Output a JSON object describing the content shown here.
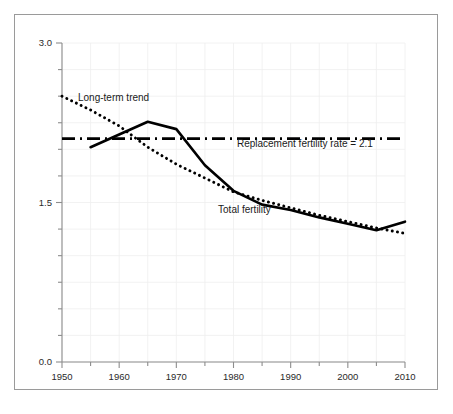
{
  "chart_data": {
    "type": "line",
    "title": "",
    "subtitle": "",
    "xlabel": "",
    "ylabel": "",
    "xlim": [
      1950,
      2010
    ],
    "ylim": [
      0.0,
      3.0
    ],
    "grid": true,
    "legend_position": "inline-annotations",
    "y_ticks": [
      0.0,
      1.5,
      3.0
    ],
    "y_tick_labels": [
      "0.0",
      "1.5",
      "3.0"
    ],
    "y_minor_tick_step": 0.25,
    "x_ticks": [
      1950,
      1960,
      1970,
      1980,
      1990,
      2000,
      2010
    ],
    "x_tick_labels": [
      "1950",
      "1960",
      "1970",
      "1980",
      "1990",
      "2000",
      "2010"
    ],
    "x_minor_tick_step": 5,
    "series": [
      {
        "name": "Total fertility",
        "style": "solid",
        "color": "#000000",
        "x": [
          1955,
          1960,
          1965,
          1970,
          1975,
          1980,
          1985,
          1990,
          1995,
          2000,
          2005,
          2010
        ],
        "values": [
          2.02,
          2.14,
          2.26,
          2.19,
          1.85,
          1.61,
          1.48,
          1.43,
          1.36,
          1.3,
          1.24,
          1.32
        ]
      },
      {
        "name": "Long-term trend",
        "style": "dotted",
        "color": "#000000",
        "x": [
          1950,
          1955,
          1960,
          1965,
          1970,
          1975,
          1980,
          1985,
          1990,
          1995,
          2000,
          2005,
          2010
        ],
        "values": [
          2.5,
          2.37,
          2.22,
          2.02,
          1.86,
          1.73,
          1.6,
          1.52,
          1.45,
          1.38,
          1.32,
          1.26,
          1.21
        ]
      },
      {
        "name": "Replacement fertility rate",
        "style": "dash-dot",
        "color": "#000000",
        "x": [
          1950,
          2010
        ],
        "values": [
          2.1,
          2.1
        ]
      }
    ],
    "annotations": [
      {
        "id": "long-term-trend",
        "text": "Long-term trend",
        "x": 1952.8,
        "y": 2.45
      },
      {
        "id": "replacement-rate",
        "text": "Replacement fertility rate = 2.1",
        "x": 1980.6,
        "y": 2.02
      },
      {
        "id": "total-fertility",
        "text": "Total fertility",
        "x": 1977.3,
        "y": 1.4
      }
    ]
  },
  "colors": {
    "series_line": "#000000",
    "axis": "#8d8d8d",
    "grid": "#efefef",
    "frame_border": "#9a9a9a",
    "background": "#ffffff",
    "text": "#1a1a1a"
  }
}
